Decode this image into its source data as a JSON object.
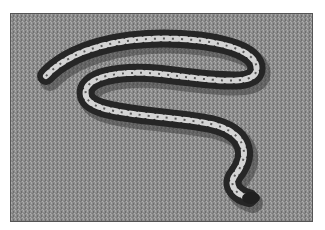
{
  "image": {
    "description": "Grayscale photograph of a patterned python snake lying in an S-curve on grass",
    "subject": "snake",
    "background": "grass lawn",
    "colors": {
      "grass": "#8f8f8f",
      "snake_dark": "#2a2a2a",
      "snake_pattern": "#d8d8d8",
      "border": "#555555",
      "page": "#ffffff"
    }
  }
}
